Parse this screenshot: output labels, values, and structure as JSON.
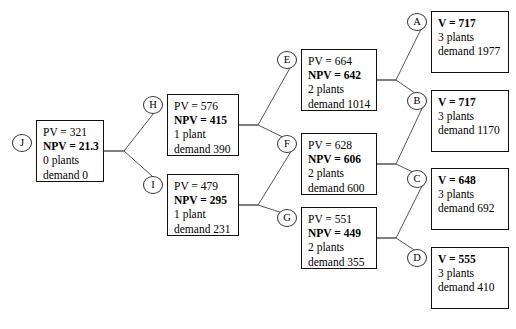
{
  "diagram": {
    "type": "decision-tree",
    "width": 516,
    "height": 329,
    "edge_color": "#555555",
    "box_border_color": "#111111",
    "background": "#ffffff"
  },
  "nodes": [
    {
      "id": "J",
      "tag": "J",
      "column": 0,
      "x": 36,
      "y": 120,
      "w": 68,
      "h": 62,
      "tag_x": 12,
      "tag_y": 134,
      "lines": [
        {
          "text": "PV = 321",
          "bold": false
        },
        {
          "text": "NPV = 21.3",
          "bold": true
        },
        {
          "text": "0 plants",
          "bold": false
        },
        {
          "text": "demand 0",
          "bold": false
        }
      ]
    },
    {
      "id": "H",
      "tag": "H",
      "column": 1,
      "x": 167,
      "y": 94,
      "w": 72,
      "h": 62,
      "tag_x": 143,
      "tag_y": 96,
      "lines": [
        {
          "text": "PV = 576",
          "bold": false
        },
        {
          "text": "NPV = 415",
          "bold": true
        },
        {
          "text": "1 plant",
          "bold": false
        },
        {
          "text": "demand 390",
          "bold": false
        }
      ]
    },
    {
      "id": "I",
      "tag": "I",
      "column": 1,
      "x": 167,
      "y": 174,
      "w": 72,
      "h": 62,
      "tag_x": 143,
      "tag_y": 176,
      "lines": [
        {
          "text": "PV = 479",
          "bold": false
        },
        {
          "text": "NPV = 295",
          "bold": true
        },
        {
          "text": "1 plant",
          "bold": false
        },
        {
          "text": "demand 231",
          "bold": false
        }
      ]
    },
    {
      "id": "E",
      "tag": "E",
      "column": 2,
      "x": 301,
      "y": 49,
      "w": 76,
      "h": 62,
      "tag_x": 277,
      "tag_y": 51,
      "lines": [
        {
          "text": "PV = 664",
          "bold": false
        },
        {
          "text": "NPV = 642",
          "bold": true
        },
        {
          "text": "2 plants",
          "bold": false
        },
        {
          "text": "demand 1014",
          "bold": false
        }
      ]
    },
    {
      "id": "F",
      "tag": "F",
      "column": 2,
      "x": 301,
      "y": 133,
      "w": 76,
      "h": 62,
      "tag_x": 277,
      "tag_y": 135,
      "lines": [
        {
          "text": "PV = 628",
          "bold": false
        },
        {
          "text": "NPV = 606",
          "bold": true
        },
        {
          "text": "2 plants",
          "bold": false
        },
        {
          "text": "demand 600",
          "bold": false
        }
      ]
    },
    {
      "id": "G",
      "tag": "G",
      "column": 2,
      "x": 301,
      "y": 207,
      "w": 76,
      "h": 62,
      "tag_x": 277,
      "tag_y": 209,
      "lines": [
        {
          "text": "PV = 551",
          "bold": false
        },
        {
          "text": "NPV = 449",
          "bold": true
        },
        {
          "text": "2 plants",
          "bold": false
        },
        {
          "text": "demand 355",
          "bold": false
        }
      ]
    },
    {
      "id": "A",
      "tag": "A",
      "column": 3,
      "x": 431,
      "y": 11,
      "w": 78,
      "h": 62,
      "tag_x": 407,
      "tag_y": 13,
      "lines": [
        {
          "text": "V = 717",
          "bold": true
        },
        {
          "text": "3 plants",
          "bold": false
        },
        {
          "text": "demand 1977",
          "bold": false
        }
      ]
    },
    {
      "id": "B",
      "tag": "B",
      "column": 3,
      "x": 431,
      "y": 90,
      "w": 78,
      "h": 62,
      "tag_x": 407,
      "tag_y": 92,
      "lines": [
        {
          "text": "V = 717",
          "bold": true
        },
        {
          "text": "3 plants",
          "bold": false
        },
        {
          "text": "demand 1170",
          "bold": false
        }
      ]
    },
    {
      "id": "C",
      "tag": "C",
      "column": 3,
      "x": 431,
      "y": 168,
      "w": 78,
      "h": 62,
      "tag_x": 407,
      "tag_y": 170,
      "lines": [
        {
          "text": "V = 648",
          "bold": true
        },
        {
          "text": "3 plants",
          "bold": false
        },
        {
          "text": "demand 692",
          "bold": false
        }
      ]
    },
    {
      "id": "D",
      "tag": "D",
      "column": 3,
      "x": 431,
      "y": 247,
      "w": 78,
      "h": 62,
      "tag_x": 407,
      "tag_y": 249,
      "lines": [
        {
          "text": "V = 555",
          "bold": true
        },
        {
          "text": "3 plants",
          "bold": false
        },
        {
          "text": "demand 410",
          "bold": false
        }
      ]
    }
  ],
  "edges": [
    {
      "from": "J",
      "to": "H",
      "fan_x": 124,
      "fan_y": 151,
      "x1": 104,
      "y1": 151,
      "x2": 161,
      "y2": 104
    },
    {
      "from": "J",
      "to": "I",
      "fan_x": 124,
      "fan_y": 151,
      "x1": 104,
      "y1": 151,
      "x2": 161,
      "y2": 184
    },
    {
      "from": "H",
      "to": "E",
      "fan_x": 258,
      "fan_y": 125,
      "x1": 239,
      "y1": 125,
      "x2": 295,
      "y2": 59
    },
    {
      "from": "H",
      "to": "F",
      "fan_x": 258,
      "fan_y": 125,
      "x1": 239,
      "y1": 125,
      "x2": 295,
      "y2": 143
    },
    {
      "from": "I",
      "to": "F",
      "fan_x": 258,
      "fan_y": 205,
      "x1": 239,
      "y1": 205,
      "x2": 295,
      "y2": 145
    },
    {
      "from": "I",
      "to": "G",
      "fan_x": 258,
      "fan_y": 205,
      "x1": 239,
      "y1": 205,
      "x2": 295,
      "y2": 217
    },
    {
      "from": "E",
      "to": "A",
      "fan_x": 396,
      "fan_y": 80,
      "x1": 377,
      "y1": 80,
      "x2": 425,
      "y2": 21
    },
    {
      "from": "E",
      "to": "B",
      "fan_x": 396,
      "fan_y": 80,
      "x1": 377,
      "y1": 80,
      "x2": 425,
      "y2": 100
    },
    {
      "from": "F",
      "to": "B",
      "fan_x": 396,
      "fan_y": 164,
      "x1": 377,
      "y1": 164,
      "x2": 425,
      "y2": 102
    },
    {
      "from": "F",
      "to": "C",
      "fan_x": 396,
      "fan_y": 164,
      "x1": 377,
      "y1": 164,
      "x2": 425,
      "y2": 178
    },
    {
      "from": "G",
      "to": "C",
      "fan_x": 396,
      "fan_y": 238,
      "x1": 377,
      "y1": 238,
      "x2": 425,
      "y2": 180
    },
    {
      "from": "G",
      "to": "D",
      "fan_x": 396,
      "fan_y": 238,
      "x1": 377,
      "y1": 238,
      "x2": 425,
      "y2": 257
    }
  ]
}
